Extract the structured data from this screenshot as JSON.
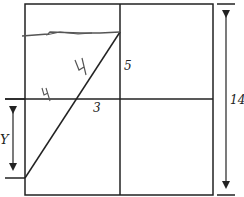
{
  "diagram": {
    "type": "geometry",
    "labels": {
      "segment_upper": "5",
      "segment_lower": "3",
      "unknown": "Y",
      "side_length": "14",
      "handwritten_upper": "4",
      "handwritten_lower": "4"
    },
    "colors": {
      "line": "#222222",
      "pencil": "#555555"
    }
  }
}
